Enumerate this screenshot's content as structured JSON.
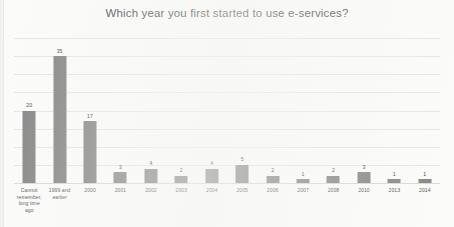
{
  "chart_data": {
    "type": "bar",
    "title": "Which year you first started to use e-services?",
    "xlabel": "",
    "ylabel": "",
    "ylim": [
      0,
      40
    ],
    "grid": true,
    "legend": false,
    "gridline_count": 8,
    "categories": [
      "Cannot remember, long time ago",
      "1999 and earlier",
      "2000",
      "2001",
      "2002",
      "2003",
      "2004",
      "2005",
      "2006",
      "2007",
      "2008",
      "2010",
      "2013",
      "2014"
    ],
    "category_display": [
      "Cannot\nremember,\nlong time\nago",
      "1999 and\nearlier",
      "2000",
      "2001",
      "2002",
      "2003",
      "2004",
      "2005",
      "2006",
      "2007",
      "2008",
      "2010",
      "2013",
      "2014"
    ],
    "values": [
      20,
      35,
      17,
      3,
      4,
      2,
      4,
      5,
      2,
      1,
      2,
      3,
      1,
      1
    ],
    "value_labels": [
      "20",
      "35",
      "17",
      "3",
      "4",
      "2",
      "4",
      "5",
      "2",
      "1",
      "2",
      "3",
      "1",
      "1"
    ],
    "bar_color": "#828282",
    "background_color": "#fbfbfa",
    "gridline_color": "#e6e5e2",
    "title_color": "#3a3a3a",
    "label_color": "#4d4d4d"
  }
}
